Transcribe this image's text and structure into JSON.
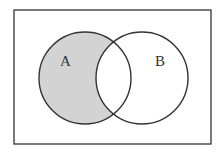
{
  "diagram": {
    "type": "venn",
    "title": "",
    "sets": [
      {
        "label": "A",
        "shaded": true
      },
      {
        "label": "B",
        "shaded": false
      }
    ],
    "shaded_region": "A minus B",
    "colors": {
      "shade": "#d3d3d3",
      "stroke": "#333333",
      "background": "#ffffff"
    }
  }
}
